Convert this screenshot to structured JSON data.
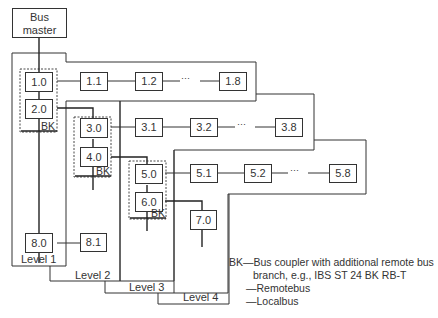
{
  "diagram": {
    "type": "bus-topology",
    "master": {
      "label_line1": "Bus",
      "label_line2": "master"
    },
    "nodes": {
      "n1_0": "1.0",
      "n1_1": "1.1",
      "n1_2": "1.2",
      "n1_8": "1.8",
      "n2_0": "2.0",
      "n3_0": "3.0",
      "n3_1": "3.1",
      "n3_2": "3.2",
      "n3_8": "3.8",
      "n4_0": "4.0",
      "n5_0": "5.0",
      "n5_1": "5.1",
      "n5_2": "5.2",
      "n5_8": "5.8",
      "n6_0": "6.0",
      "n7_0": "7.0",
      "n8_0": "8.0",
      "n8_1": "8.1"
    },
    "ellipsis": "···",
    "bk_label": "BK",
    "levels": [
      "Level 1",
      "Level 2",
      "Level 3",
      "Level 4"
    ],
    "legend": {
      "bk_line1": "BK—Bus coupler with additional remote bus",
      "bk_line2": "branch, e.g., IBS ST 24 BK RB-T",
      "remotebus": "—Remotebus",
      "localbus": "—Localbus"
    },
    "colors": {
      "line": "#333333",
      "background": "#ffffff"
    }
  }
}
